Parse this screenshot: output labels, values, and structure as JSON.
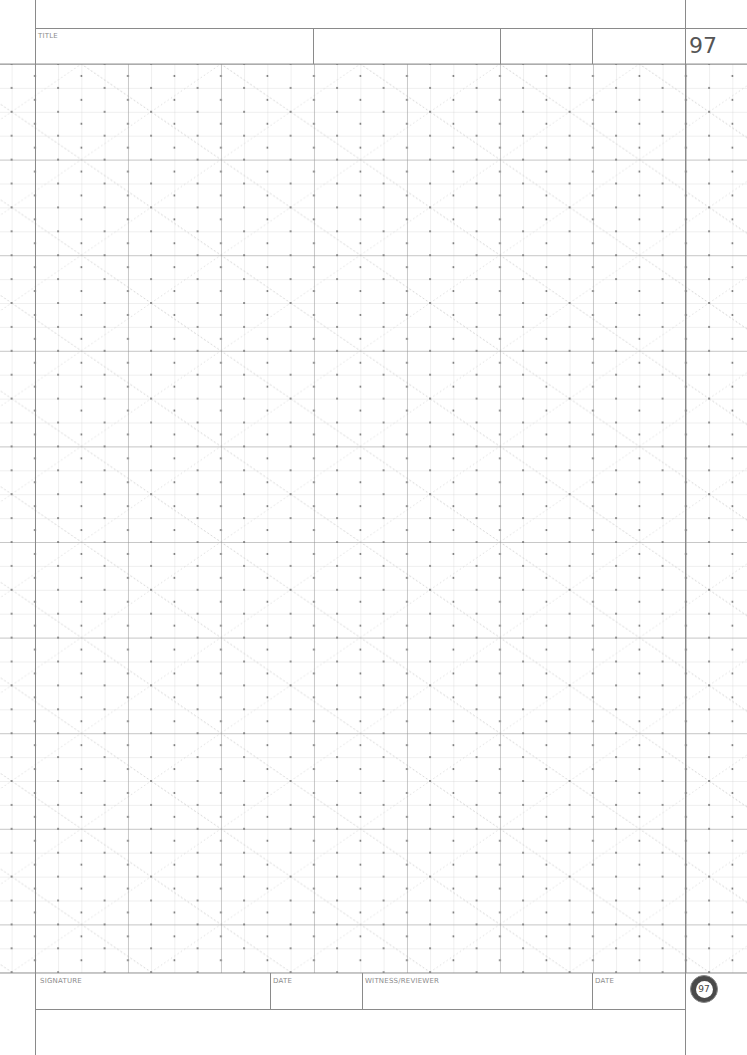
{
  "header": {
    "title_label": "TITLE",
    "page_number": "97"
  },
  "footer": {
    "signature_label": "SIGNATURE",
    "date_label_1": "DATE",
    "witness_label": "WITNESS/REVIEWER",
    "date_label_2": "DATE",
    "badge_number": "97"
  },
  "grid": {
    "type": "isometric-dot-square-grid",
    "columns": 32,
    "rows": 38,
    "cell_width_px": 23.2,
    "cell_height_px": 23.9,
    "major_every": 4,
    "colors": {
      "minor_line": "#c8c8c8",
      "major_line": "#8a8a8a",
      "dot": "#666666",
      "diagonal": "#cfcfcf"
    }
  }
}
